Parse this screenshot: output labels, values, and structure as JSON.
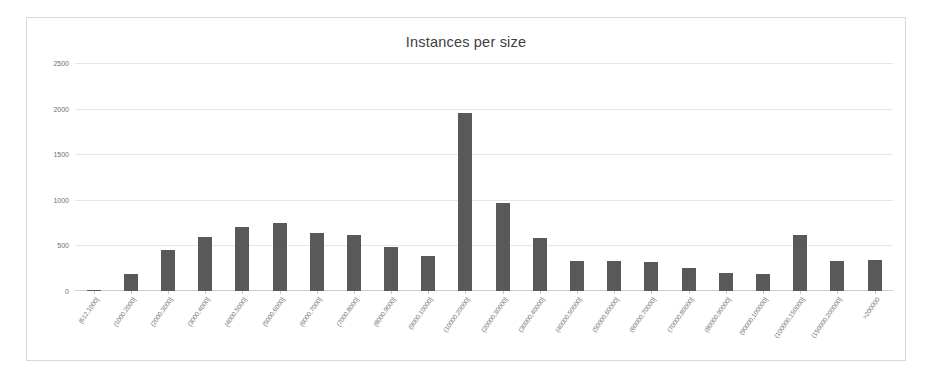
{
  "chart_data": {
    "type": "bar",
    "title": "Instances per size",
    "xlabel": "",
    "ylabel": "",
    "ylim": [
      0,
      2500
    ],
    "yticks": [
      0,
      500,
      1000,
      1500,
      2000,
      2500
    ],
    "grid": true,
    "legend": null,
    "bar_color": "#595959",
    "categories": [
      "(612,1000]",
      "(1000,2000]",
      "(2000,3000]",
      "(3000,4000]",
      "(4000,5000]",
      "(5000,6000]",
      "(6000,7000]",
      "(7000,8000]",
      "(8000,9000]",
      "(9000,10000]",
      "(10000,20000]",
      "(20000,30000]",
      "(30000,40000]",
      "(40000,50000]",
      "(50000,60000]",
      "(60000,70000]",
      "(70000,80000]",
      "(80000,90000]",
      "(90000,100000]",
      "(100000,150000]",
      "(150000,200000]",
      ">200000"
    ],
    "values": [
      10,
      185,
      455,
      595,
      700,
      750,
      640,
      615,
      480,
      380,
      1950,
      960,
      580,
      325,
      330,
      320,
      250,
      195,
      190,
      610,
      330,
      340
    ]
  }
}
